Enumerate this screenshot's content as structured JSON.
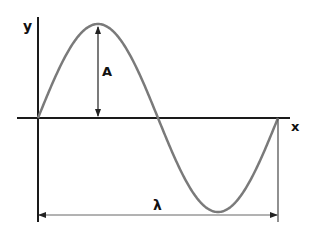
{
  "labels": {
    "y_axis": "y",
    "x_axis": "x",
    "amplitude": "A",
    "wavelength": "λ"
  },
  "colors": {
    "axis": "#1a1a1a",
    "wave": "#7a7a7a",
    "arrow": "#333333",
    "background": "#ffffff"
  },
  "geometry": {
    "origin": [
      38,
      118
    ],
    "x_axis_range": [
      17,
      290
    ],
    "y_axis_range": [
      17,
      222
    ],
    "wavelength_px": 240,
    "amplitude_px": 94,
    "peak": [
      98,
      24
    ],
    "trough": [
      218,
      212
    ],
    "end": [
      278,
      118
    ]
  }
}
